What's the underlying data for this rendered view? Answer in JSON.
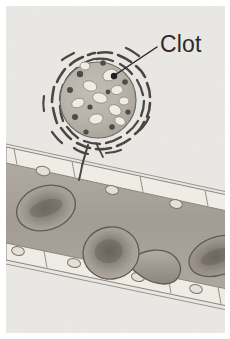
{
  "figure": {
    "style": "grayscale-sepia-textbook-illustration",
    "width": 230,
    "height": 339,
    "background_color": "#e9e7e3",
    "page_margin_color": "#ffffff"
  },
  "labels": [
    {
      "id": "clot",
      "text": "Clot",
      "x": 160,
      "y": 33,
      "font_size": 23,
      "color": "#2b2b2b",
      "leader_line": {
        "from_x": 157,
        "from_y": 47,
        "to_x": 113,
        "to_y": 76,
        "color": "#262626",
        "width": 1.4,
        "endpoint_dot_radius": 3.2
      }
    }
  ],
  "clot": {
    "name": "clot",
    "center_x": 98,
    "center_y": 100,
    "radius": 47,
    "body_radius": 38,
    "body_fill": "#b9b4ac",
    "body_stroke": "#6f6a62",
    "halo_description": "dashed fibrin strands radiating around clot",
    "halo_stroke": "#4a4741",
    "halo_dash_count": 34,
    "light_inclusions": [
      {
        "cx": 110,
        "cy": 75,
        "rx": 7.5,
        "ry": 5.5,
        "rot": -25
      },
      {
        "cx": 90,
        "cy": 86,
        "rx": 7.0,
        "ry": 5.0,
        "rot": 20
      },
      {
        "cx": 117,
        "cy": 90,
        "rx": 6.0,
        "ry": 4.5,
        "rot": -10
      },
      {
        "cx": 100,
        "cy": 98,
        "rx": 7.5,
        "ry": 5.0,
        "rot": 15
      },
      {
        "cx": 78,
        "cy": 103,
        "rx": 6.5,
        "ry": 4.5,
        "rot": -20
      },
      {
        "cx": 115,
        "cy": 110,
        "rx": 6.5,
        "ry": 5.0,
        "rot": 30
      },
      {
        "cx": 96,
        "cy": 119,
        "rx": 7.0,
        "ry": 5.0,
        "rot": -12
      },
      {
        "cx": 120,
        "cy": 121,
        "rx": 5.5,
        "ry": 4.0,
        "rot": 25
      },
      {
        "cx": 85,
        "cy": 66,
        "rx": 5.0,
        "ry": 4.0,
        "rot": 10
      },
      {
        "cx": 124,
        "cy": 101,
        "rx": 5.0,
        "ry": 4.0,
        "rot": 0
      }
    ],
    "dark_granules": [
      {
        "cx": 80,
        "cy": 74,
        "r": 3.2
      },
      {
        "cx": 70,
        "cy": 90,
        "r": 3.0
      },
      {
        "cx": 103,
        "cy": 63,
        "r": 2.8
      },
      {
        "cx": 125,
        "cy": 82,
        "r": 2.8
      },
      {
        "cx": 75,
        "cy": 117,
        "r": 3.0
      },
      {
        "cx": 112,
        "cy": 127,
        "r": 2.8
      },
      {
        "cx": 90,
        "cy": 107,
        "r": 2.6
      },
      {
        "cx": 128,
        "cy": 112,
        "r": 2.6
      },
      {
        "cx": 108,
        "cy": 92,
        "r": 2.4
      },
      {
        "cx": 86,
        "cy": 132,
        "r": 2.6
      }
    ],
    "fibrin_tail": {
      "description": "strand anchoring clot to vessel wall",
      "stroke": "#4a4741",
      "width": 2.2
    }
  },
  "vessel": {
    "name": "blood-vessel",
    "orientation": "diagonal-descending-left-to-right",
    "lumen_fill": "#a6a099",
    "lumen_fill_light": "#b3ada5",
    "wall_fill": "#efece6",
    "wall_stroke": "#8a857c",
    "endothelial_cells_upper": [
      {
        "cx": 43,
        "cy": 171,
        "rx": 7.0,
        "ry": 4.6
      },
      {
        "cx": 112,
        "cy": 190,
        "rx": 6.6,
        "ry": 4.4
      },
      {
        "cx": 176,
        "cy": 214,
        "rx": 6.4,
        "ry": 4.4
      }
    ],
    "endothelial_cells_lower": [
      {
        "cx": 18,
        "cy": 251,
        "rx": 6.4,
        "ry": 4.4
      },
      {
        "cx": 73,
        "cy": 277,
        "rx": 6.6,
        "ry": 4.4
      },
      {
        "cx": 139,
        "cy": 305,
        "rx": 6.6,
        "ry": 4.4
      },
      {
        "cx": 205,
        "cy": 318,
        "rx": 6.4,
        "ry": 4.4
      }
    ],
    "wall_segment_dividers_upper": 5,
    "wall_segment_dividers_lower": 5
  },
  "red_blood_cells": [
    {
      "id": "rbc-left",
      "cx": 46,
      "cy": 208,
      "rx": 30,
      "ry": 22,
      "rot": -18,
      "view": "face-on-biconcave",
      "fill": "#a49d94",
      "center_fill": "#7e776e",
      "stroke": "#5f5ا",
      "stroke_color": "#5f5b54"
    },
    {
      "id": "rbc-center",
      "cx": 111,
      "cy": 253,
      "rx": 27,
      "ry": 25,
      "rot": -8,
      "view": "face-on-biconcave",
      "fill": "#a8a199",
      "center_fill": "#78716a",
      "stroke_color": "#5f5b54"
    },
    {
      "id": "rbc-edge-on",
      "cx": 152,
      "cy": 262,
      "rx": 26,
      "ry": 11,
      "rot": 28,
      "view": "edge-on-curved",
      "fill": "#a8a199",
      "stroke_color": "#5f5b54"
    },
    {
      "id": "rbc-right-cropped",
      "cx": 215,
      "cy": 256,
      "rx": 28,
      "ry": 18,
      "rot": -20,
      "view": "face-on-cropped",
      "fill": "#a49d94",
      "center_fill": "#7c756d",
      "stroke_color": "#5f5b54"
    }
  ],
  "colors": {
    "background": "#e9e7e3",
    "clot_body": "#b9b4ac",
    "vessel_lumen": "#a6a099",
    "vessel_wall": "#efece6",
    "outline": "#6f6a62",
    "label_text": "#2b2b2b",
    "leader_line": "#262626"
  }
}
